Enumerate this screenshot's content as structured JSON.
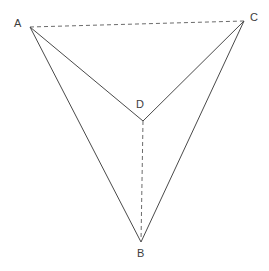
{
  "figure": {
    "kind": "tetrahedron-wireframe",
    "width": 269,
    "height": 271,
    "background_color": "#ffffff",
    "solid_line_color": "#4a4a4a",
    "dashed_line_color": "#6b6b6b",
    "label_color": "#3d3d3d"
  },
  "vertices": [
    {
      "id": "A",
      "label": "A",
      "x": 30,
      "y": 27,
      "label_x": 14,
      "label_y": 18
    },
    {
      "id": "B",
      "label": "B",
      "x": 141,
      "y": 242,
      "label_x": 137,
      "label_y": 248
    },
    {
      "id": "C",
      "label": "C",
      "x": 244,
      "y": 21,
      "label_x": 250,
      "label_y": 12
    },
    {
      "id": "D",
      "label": "D",
      "x": 143,
      "y": 121,
      "label_x": 136,
      "label_y": 99
    }
  ],
  "edges": [
    {
      "id": "AC",
      "from": "A",
      "to": "C",
      "style": "dashed",
      "hidden": true,
      "x1": 30,
      "y1": 27,
      "x2": 244,
      "y2": 21
    },
    {
      "id": "AD",
      "from": "A",
      "to": "D",
      "style": "solid",
      "hidden": false,
      "x1": 30,
      "y1": 27,
      "x2": 143,
      "y2": 121
    },
    {
      "id": "AB",
      "from": "A",
      "to": "B",
      "style": "solid",
      "hidden": false,
      "x1": 30,
      "y1": 27,
      "x2": 141,
      "y2": 242
    },
    {
      "id": "CD",
      "from": "C",
      "to": "D",
      "style": "solid",
      "hidden": false,
      "x1": 244,
      "y1": 21,
      "x2": 143,
      "y2": 121
    },
    {
      "id": "CB",
      "from": "C",
      "to": "B",
      "style": "solid",
      "hidden": false,
      "x1": 244,
      "y1": 21,
      "x2": 141,
      "y2": 242
    },
    {
      "id": "DB",
      "from": "D",
      "to": "B",
      "style": "dashed",
      "hidden": true,
      "x1": 143,
      "y1": 121,
      "x2": 141,
      "y2": 242
    }
  ]
}
